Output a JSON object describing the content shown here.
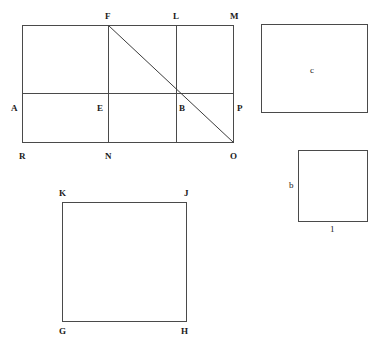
{
  "figure": {
    "background_color": "#ffffff",
    "line_color": "#4a4a4a",
    "label_color": "#1a1a1a"
  },
  "shapes": {
    "main_rectangle": {
      "name": "rectangle-RMPO",
      "x": 22,
      "y": 25,
      "width": 212,
      "height": 118,
      "horizontal_divider_y": 93,
      "vertical_divider_1_x": 108,
      "vertical_divider_2_x": 176,
      "diagonal": {
        "x1": 108,
        "y1": 25,
        "x2": 234,
        "y2": 143
      }
    },
    "square_KJHG": {
      "name": "square-KJHG",
      "x": 62,
      "y": 202,
      "width": 125,
      "height": 120
    },
    "rectangle_c": {
      "name": "rectangle-c",
      "x": 261,
      "y": 24,
      "width": 107,
      "height": 89
    },
    "square_b": {
      "name": "square-b",
      "x": 298,
      "y": 150,
      "width": 70,
      "height": 72
    }
  },
  "labels": {
    "vertices": [
      {
        "id": "F",
        "text": "F",
        "x": 105,
        "y": 12
      },
      {
        "id": "L",
        "text": "L",
        "x": 173,
        "y": 12
      },
      {
        "id": "M",
        "text": "M",
        "x": 230,
        "y": 12
      },
      {
        "id": "A",
        "text": "A",
        "x": 11,
        "y": 104
      },
      {
        "id": "E",
        "text": "E",
        "x": 97,
        "y": 104
      },
      {
        "id": "B",
        "text": "B",
        "x": 179,
        "y": 104
      },
      {
        "id": "P",
        "text": "P",
        "x": 237,
        "y": 104
      },
      {
        "id": "R",
        "text": "R",
        "x": 19,
        "y": 152
      },
      {
        "id": "N",
        "text": "N",
        "x": 105,
        "y": 152
      },
      {
        "id": "O",
        "text": "O",
        "x": 230,
        "y": 152
      },
      {
        "id": "K",
        "text": "K",
        "x": 59,
        "y": 189
      },
      {
        "id": "J",
        "text": "J",
        "x": 184,
        "y": 189
      },
      {
        "id": "G",
        "text": "G",
        "x": 59,
        "y": 327
      },
      {
        "id": "H",
        "text": "H",
        "x": 181,
        "y": 327
      }
    ],
    "dimensions": [
      {
        "id": "c",
        "text": "c",
        "x": 310,
        "y": 66
      },
      {
        "id": "b",
        "text": "b",
        "x": 289,
        "y": 181
      },
      {
        "id": "one",
        "text": "1",
        "x": 330,
        "y": 225
      }
    ]
  }
}
